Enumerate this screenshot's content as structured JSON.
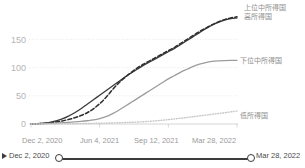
{
  "chart_data": {
    "type": "line",
    "title": "",
    "xlabel": "",
    "ylabel": "",
    "ylim": [
      0,
      195
    ],
    "yticks": [
      0,
      50,
      100,
      150
    ],
    "ytick_labels": [
      "0",
      "50",
      "100",
      "150"
    ],
    "grid": true,
    "legend_position": "right-inline",
    "x": [
      "Dec 2, 2020",
      "Jun 4, 2021",
      "Sep 12, 2021",
      "Mar 28, 2022"
    ],
    "xtick_labels": [
      "Dec 2, 2020",
      "Jun 4, 2021",
      "Sep 12, 2021",
      "Mar 28, 2022"
    ],
    "series": [
      {
        "name": "上位中所得国",
        "style": "solid",
        "color": "#3a3a3a",
        "values": [
          0,
          57,
          118,
          188
        ],
        "points": [
          [
            0,
            0
          ],
          [
            4,
            0.5
          ],
          [
            8,
            1.5
          ],
          [
            12,
            3
          ],
          [
            16,
            5.5
          ],
          [
            20,
            9
          ],
          [
            24,
            14
          ],
          [
            28,
            20
          ],
          [
            32,
            27
          ],
          [
            36,
            35
          ],
          [
            40,
            43
          ],
          [
            44,
            51
          ],
          [
            48,
            59
          ],
          [
            52,
            67
          ],
          [
            56,
            75
          ],
          [
            60,
            83
          ],
          [
            64,
            90
          ],
          [
            68,
            97
          ],
          [
            72,
            104
          ],
          [
            76,
            110
          ],
          [
            80,
            116
          ],
          [
            84,
            122
          ],
          [
            88,
            128
          ],
          [
            92,
            134
          ],
          [
            96,
            141
          ],
          [
            100,
            148
          ],
          [
            104,
            155
          ],
          [
            108,
            162
          ],
          [
            112,
            169
          ],
          [
            116,
            175
          ],
          [
            120,
            180
          ],
          [
            124,
            184
          ],
          [
            128,
            187
          ],
          [
            132,
            188
          ]
        ]
      },
      {
        "name": "高所得国",
        "style": "dashed",
        "color": "#2e2e2e",
        "values": [
          0,
          43,
          115,
          190
        ],
        "points": [
          [
            0,
            0
          ],
          [
            4,
            0.3
          ],
          [
            8,
            1
          ],
          [
            12,
            2
          ],
          [
            16,
            3.5
          ],
          [
            20,
            5.5
          ],
          [
            24,
            8
          ],
          [
            28,
            11
          ],
          [
            32,
            15
          ],
          [
            36,
            20
          ],
          [
            40,
            27
          ],
          [
            44,
            36
          ],
          [
            48,
            47
          ],
          [
            52,
            60
          ],
          [
            56,
            72
          ],
          [
            60,
            82
          ],
          [
            64,
            91
          ],
          [
            68,
            99
          ],
          [
            72,
            106
          ],
          [
            76,
            112
          ],
          [
            80,
            118
          ],
          [
            84,
            124
          ],
          [
            88,
            130
          ],
          [
            92,
            136
          ],
          [
            96,
            143
          ],
          [
            100,
            150
          ],
          [
            104,
            157
          ],
          [
            108,
            164
          ],
          [
            112,
            170
          ],
          [
            116,
            176
          ],
          [
            120,
            181
          ],
          [
            124,
            185
          ],
          [
            128,
            188
          ],
          [
            132,
            190
          ]
        ]
      },
      {
        "name": "下位中所得国",
        "style": "solid",
        "color": "#9c9c9c",
        "values": [
          0,
          6,
          36,
          112
        ],
        "points": [
          [
            0,
            0
          ],
          [
            4,
            0.2
          ],
          [
            8,
            0.5
          ],
          [
            12,
            1
          ],
          [
            16,
            1.6
          ],
          [
            20,
            2.3
          ],
          [
            24,
            3
          ],
          [
            28,
            3.8
          ],
          [
            32,
            4.7
          ],
          [
            36,
            5.8
          ],
          [
            40,
            7.2
          ],
          [
            44,
            9.5
          ],
          [
            48,
            13
          ],
          [
            52,
            18
          ],
          [
            56,
            24
          ],
          [
            60,
            31
          ],
          [
            64,
            38
          ],
          [
            68,
            45
          ],
          [
            72,
            52
          ],
          [
            76,
            59
          ],
          [
            80,
            66
          ],
          [
            84,
            73
          ],
          [
            88,
            80
          ],
          [
            92,
            86
          ],
          [
            96,
            92
          ],
          [
            100,
            97
          ],
          [
            104,
            102
          ],
          [
            108,
            106
          ],
          [
            112,
            109
          ],
          [
            116,
            111
          ],
          [
            120,
            112
          ],
          [
            124,
            112.5
          ],
          [
            128,
            112.7
          ],
          [
            132,
            112.8
          ]
        ]
      },
      {
        "name": "低所得国",
        "style": "dotted",
        "color": "#c8c8c8",
        "values": [
          0,
          0.5,
          3,
          23
        ],
        "points": [
          [
            0,
            0
          ],
          [
            8,
            0.1
          ],
          [
            16,
            0.2
          ],
          [
            24,
            0.4
          ],
          [
            32,
            0.7
          ],
          [
            40,
            1.1
          ],
          [
            48,
            1.6
          ],
          [
            56,
            2.2
          ],
          [
            64,
            3
          ],
          [
            72,
            4
          ],
          [
            76,
            4.8
          ],
          [
            80,
            5.6
          ],
          [
            84,
            6.6
          ],
          [
            88,
            7.8
          ],
          [
            92,
            9
          ],
          [
            96,
            10.3
          ],
          [
            100,
            11.6
          ],
          [
            104,
            13
          ],
          [
            108,
            14.4
          ],
          [
            112,
            15.8
          ],
          [
            116,
            17.2
          ],
          [
            120,
            18.6
          ],
          [
            124,
            20
          ],
          [
            128,
            21.5
          ],
          [
            132,
            23
          ]
        ]
      }
    ]
  },
  "series_labels": [
    {
      "text": "上位中所得国"
    },
    {
      "text": "高所得国"
    },
    {
      "text": "下位中所得国"
    },
    {
      "text": "低所得国"
    }
  ],
  "timeline": {
    "play_label": "play-button",
    "start_date": "Dec 2, 2020",
    "end_date": "Mar 28, 2022"
  }
}
